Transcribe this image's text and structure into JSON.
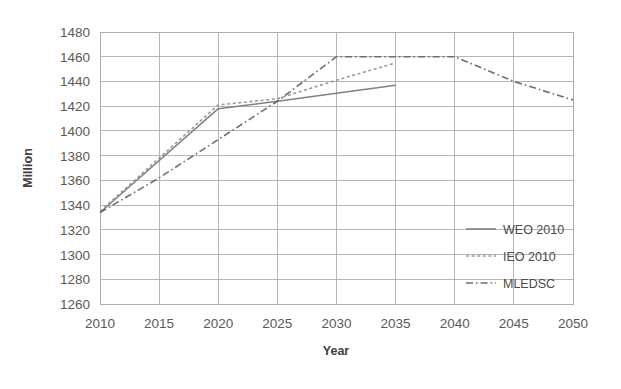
{
  "chart_data": {
    "type": "line",
    "title": "",
    "xlabel": "Year",
    "ylabel": "Million",
    "x": [
      2010,
      2015,
      2020,
      2025,
      2030,
      2035,
      2040,
      2045,
      2050
    ],
    "xlim": [
      2010,
      2050
    ],
    "ylim": [
      1260,
      1480
    ],
    "ytick_step": 20,
    "xtick_step": 5,
    "grid": true,
    "legend_position": "lower-right",
    "xticks": [
      "2010",
      "2015",
      "2020",
      "2025",
      "2030",
      "2035",
      "2040",
      "2045",
      "2050"
    ],
    "yticks": [
      "1260",
      "1280",
      "1300",
      "1320",
      "1340",
      "1360",
      "1380",
      "1400",
      "1420",
      "1440",
      "1460",
      "1480"
    ],
    "series": [
      {
        "name": "WEO 2010",
        "style": "solid",
        "color": "#808080",
        "x": [
          2010,
          2020,
          2025,
          2035
        ],
        "values": [
          1334,
          1418,
          1424,
          1437
        ]
      },
      {
        "name": "IEO 2010",
        "style": "dotted",
        "color": "#9a9a9a",
        "x": [
          2010,
          2020,
          2025,
          2030,
          2035
        ],
        "values": [
          1335,
          1421,
          1426,
          1441,
          1455
        ]
      },
      {
        "name": "MLEDSC",
        "style": "dash-dot",
        "color": "#6e6e6e",
        "x": [
          2010,
          2015,
          2020,
          2025,
          2030,
          2035,
          2040,
          2045,
          2050
        ],
        "values": [
          1334,
          1362,
          1393,
          1424,
          1460,
          1460,
          1460,
          1440,
          1425
        ]
      }
    ]
  },
  "legend": {
    "items": [
      {
        "label": "WEO 2010",
        "style": "solid"
      },
      {
        "label": "IEO 2010",
        "style": "dotted"
      },
      {
        "label": "MLEDSC",
        "style": "dash-dot"
      }
    ]
  },
  "axes": {
    "y_title": "Million",
    "x_title": "Year"
  },
  "colors": {
    "grid": "#aeaeae",
    "text": "#5a5a5a",
    "axis_title": "#3f3f3f",
    "background": "#ffffff"
  }
}
